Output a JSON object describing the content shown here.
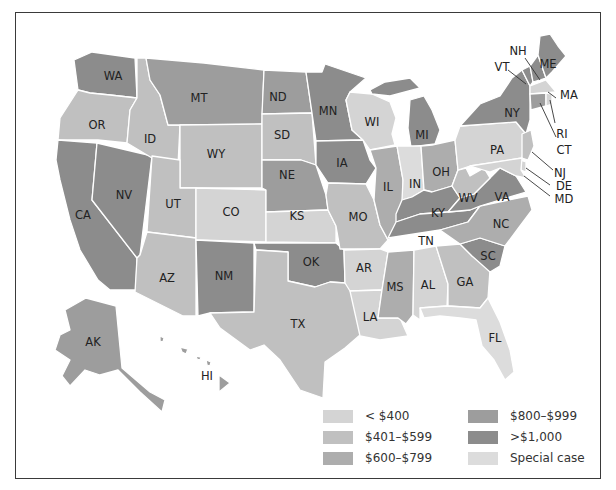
{
  "title_partial": "",
  "colors": {
    "lt400": "#d4d4d4",
    "r401_599": "#c0c0c0",
    "r600_799": "#adadad",
    "r800_999": "#9d9d9d",
    "gt1000": "#8c8c8c",
    "special": "#dcdcdc"
  },
  "legend": {
    "items": [
      {
        "key": "lt400",
        "label": "< $400"
      },
      {
        "key": "r401_599",
        "label": "$401–$599"
      },
      {
        "key": "r600_799",
        "label": "$600–$799"
      },
      {
        "key": "r800_999",
        "label": "$800–$999"
      },
      {
        "key": "gt1000",
        "label": ">$1,000"
      },
      {
        "key": "special",
        "label": "Special case"
      }
    ]
  },
  "states": {
    "WA": {
      "label": "WA",
      "cat": "gt1000"
    },
    "OR": {
      "label": "OR",
      "cat": "r401_599"
    },
    "CA": {
      "label": "CA",
      "cat": "gt1000"
    },
    "NV": {
      "label": "NV",
      "cat": "gt1000"
    },
    "ID": {
      "label": "ID",
      "cat": "r401_599"
    },
    "MT": {
      "label": "MT",
      "cat": "r800_999"
    },
    "WY": {
      "label": "WY",
      "cat": "r401_599"
    },
    "UT": {
      "label": "UT",
      "cat": "r401_599"
    },
    "AZ": {
      "label": "AZ",
      "cat": "r401_599"
    },
    "CO": {
      "label": "CO",
      "cat": "lt400"
    },
    "NM": {
      "label": "NM",
      "cat": "gt1000"
    },
    "ND": {
      "label": "ND",
      "cat": "r800_999"
    },
    "SD": {
      "label": "SD",
      "cat": "r401_599"
    },
    "NE": {
      "label": "NE",
      "cat": "r800_999"
    },
    "KS": {
      "label": "KS",
      "cat": "lt400"
    },
    "OK": {
      "label": "OK",
      "cat": "gt1000"
    },
    "TX": {
      "label": "TX",
      "cat": "r401_599"
    },
    "MN": {
      "label": "MN",
      "cat": "gt1000"
    },
    "IA": {
      "label": "IA",
      "cat": "gt1000"
    },
    "MO": {
      "label": "MO",
      "cat": "r401_599"
    },
    "AR": {
      "label": "AR",
      "cat": "lt400"
    },
    "LA": {
      "label": "LA",
      "cat": "lt400"
    },
    "WI": {
      "label": "WI",
      "cat": "lt400"
    },
    "IL": {
      "label": "IL",
      "cat": "r600_799"
    },
    "MI": {
      "label": "MI",
      "cat": "gt1000"
    },
    "IN": {
      "label": "IN",
      "cat": "special"
    },
    "OH": {
      "label": "OH",
      "cat": "r600_799"
    },
    "KY": {
      "label": "KY",
      "cat": "gt1000"
    },
    "TN": {
      "label": "TN",
      "cat": "gt1000"
    },
    "MS": {
      "label": "MS",
      "cat": "r600_799"
    },
    "AL": {
      "label": "AL",
      "cat": "lt400"
    },
    "GA": {
      "label": "GA",
      "cat": "r401_599"
    },
    "FL": {
      "label": "FL",
      "cat": "special"
    },
    "SC": {
      "label": "SC",
      "cat": "gt1000"
    },
    "NC": {
      "label": "NC",
      "cat": "r600_799"
    },
    "VA": {
      "label": "VA",
      "cat": "gt1000"
    },
    "WV": {
      "label": "WV",
      "cat": "r401_599"
    },
    "PA": {
      "label": "PA",
      "cat": "lt400"
    },
    "NY": {
      "label": "NY",
      "cat": "gt1000"
    },
    "VT": {
      "label": "VT",
      "cat": "gt1000"
    },
    "NH": {
      "label": "NH",
      "cat": "gt1000"
    },
    "ME": {
      "label": "ME",
      "cat": "gt1000"
    },
    "MA": {
      "label": "MA",
      "cat": "lt400"
    },
    "RI": {
      "label": "RI",
      "cat": "lt400"
    },
    "CT": {
      "label": "CT",
      "cat": "r800_999"
    },
    "NJ": {
      "label": "NJ",
      "cat": "r401_599"
    },
    "DE": {
      "label": "DE",
      "cat": "lt400"
    },
    "MD": {
      "label": "MD",
      "cat": "lt400"
    },
    "AK": {
      "label": "AK",
      "cat": "r800_999"
    },
    "HI": {
      "label": "HI",
      "cat": "r800_999"
    }
  }
}
